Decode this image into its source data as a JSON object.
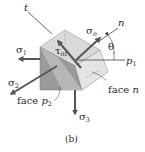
{
  "figure": {
    "caption": "(b)",
    "labels": {
      "t_axis": "t",
      "n_axis": "n",
      "p1_axis": "p",
      "p1_sub": "1",
      "theta": "θ",
      "sigma1": "σ",
      "sigma1_sub": "1",
      "sigma2": "σ",
      "sigma2_sub": "2",
      "sigma3": "σ",
      "sigma3_sub": "3",
      "sigma_n": "σ",
      "sigma_n_sub": "n",
      "tau_nt": "τ",
      "tau_nt_sub": "nt",
      "face_n_prefix": "face ",
      "face_n_var": "n",
      "face_p2_prefix": "face ",
      "face_p2_var": "p",
      "face_p2_sub": "2"
    },
    "colors": {
      "top_face": "#d9d9d9",
      "front_face": "#9a9a9a",
      "inclined_face": "#e4e4e4",
      "arrow": "#555555",
      "line": "#444444"
    }
  }
}
